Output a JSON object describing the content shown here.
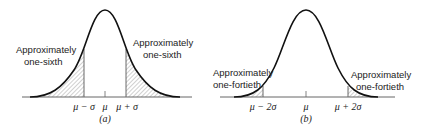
{
  "panels": [
    {
      "id": "a",
      "caption": "(a)",
      "annotation_left": [
        "Approximately",
        "one-sixth"
      ],
      "annotation_right": [
        "Approximately",
        "one-sixth"
      ],
      "ticks": {
        "left": "μ − σ",
        "center": "μ",
        "right": "μ + σ"
      },
      "shaded_tails_sd": 1
    },
    {
      "id": "b",
      "caption": "(b)",
      "annotation_left": [
        "Approximately",
        "one-fortieth"
      ],
      "annotation_right": [
        "Approximately",
        "one-fortieth"
      ],
      "ticks": {
        "left": "μ − 2σ",
        "center": "μ",
        "right": "μ + 2σ"
      },
      "shaded_tails_sd": 2
    }
  ],
  "colors": {
    "curve": "#111111",
    "axis": "#555555",
    "hatch": "#666666"
  }
}
